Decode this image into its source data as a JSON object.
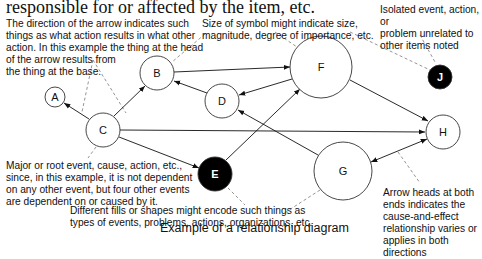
{
  "heading": "responsible for or affected by the item, etc.",
  "caption": "Example of a relationship diagram",
  "notes": {
    "arrow_direction": "The direction of the arrow indicates such\nthings as what action results in what other\naction. In this example the thing at the head\nof the arrow results from\nthe thing at the base.",
    "symbol_size": "Size of symbol might indicate size,\nmagnitude, degree of importance, etc.",
    "isolated": "Isolated event, action, or\nproblem unrelated to\nother items noted",
    "root_event": "Major or root event, cause, action, etc.,\nsince, in this example, it is not dependent\non any other event, but four other events\nare dependent on or caused by it.",
    "fills_shapes": "Different fills or shapes might encode such things as\ntypes of events, problems, actions, organizations, etc.",
    "bidirectional": "Arrow heads at both\nends indicates the\ncause-and-effect\nrelationship varies or\napplies in both directions"
  },
  "nodes": {
    "A": {
      "label": "A",
      "fill": "white"
    },
    "B": {
      "label": "B",
      "fill": "white"
    },
    "C": {
      "label": "C",
      "fill": "white"
    },
    "D": {
      "label": "D",
      "fill": "white"
    },
    "E": {
      "label": "E",
      "fill": "black"
    },
    "F": {
      "label": "F",
      "fill": "white"
    },
    "G": {
      "label": "G",
      "fill": "white"
    },
    "H": {
      "label": "H",
      "fill": "white"
    },
    "J": {
      "label": "J",
      "fill": "black"
    }
  },
  "edges": [
    {
      "from": "C",
      "to": "A"
    },
    {
      "from": "C",
      "to": "B"
    },
    {
      "from": "C",
      "to": "H"
    },
    {
      "from": "C",
      "to": "E"
    },
    {
      "from": "B",
      "to": "F"
    },
    {
      "from": "D",
      "to": "B"
    },
    {
      "from": "F",
      "to": "D"
    },
    {
      "from": "E",
      "to": "F"
    },
    {
      "from": "G",
      "to": "D"
    },
    {
      "from": "F",
      "to": "H"
    },
    {
      "from": "G",
      "to": "H",
      "bidirectional": true
    }
  ]
}
